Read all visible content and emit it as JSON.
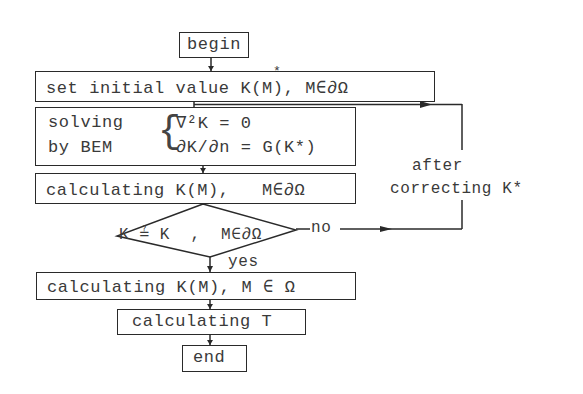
{
  "flowchart": {
    "begin": "begin",
    "set_initial": "set initial value K(M), M∈∂Ω",
    "set_initial_star": "*",
    "solving_l1": "solving",
    "solving_l2": "by BEM",
    "eq1": "∇²K = 0",
    "eq2": "∂K/∂n = G(K*)",
    "calc_boundary": "calculating K(M),   M∈∂Ω",
    "decision": "K ≟ K  ,  M∈∂Ω",
    "decision_no": "no",
    "decision_yes": "yes",
    "feedback_l1": "after",
    "feedback_l2": "correcting K*",
    "calc_domain": "calculating K(M), M ∈ Ω",
    "calc_T": "calculating T",
    "end": "end"
  },
  "colors": {
    "line": "#2a2a2a",
    "text": "#3a3a3a",
    "background": "#ffffff"
  }
}
